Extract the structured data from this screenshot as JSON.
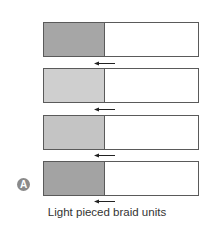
{
  "diagram": {
    "caption": "Light pieced braid units",
    "badge": "A",
    "units": [
      {
        "shade_color": "#a6a6a6",
        "arrow": "left-arrow"
      },
      {
        "shade_color": "#cfcfcf",
        "arrow": "left-arrow"
      },
      {
        "shade_color": "#c4c4c4",
        "arrow": "left-arrow"
      },
      {
        "shade_color": "#a3a3a3",
        "arrow": "left-arrow"
      }
    ]
  }
}
